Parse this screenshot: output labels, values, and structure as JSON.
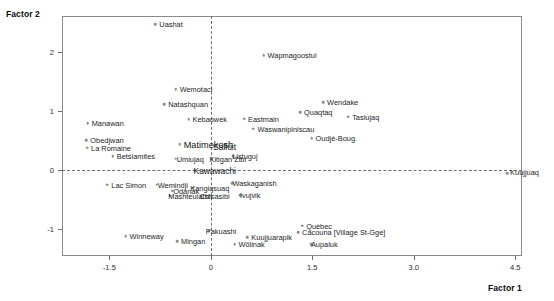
{
  "axes": {
    "x_title": "Factor 1",
    "y_title": "Factor 2",
    "x_ticks": [
      "-1.5",
      "0",
      "1.5",
      "3.0",
      "4.5"
    ],
    "y_ticks": [
      "2",
      "1",
      "0",
      "-1"
    ]
  },
  "chart_data": {
    "type": "scatter",
    "title": "",
    "xlabel": "Factor 1",
    "ylabel": "Factor 2",
    "xlim": [
      -2.2,
      4.6
    ],
    "ylim": [
      -1.45,
      2.6
    ],
    "xticks": [
      -1.5,
      0,
      1.5,
      3.0,
      4.5
    ],
    "yticks": [
      2,
      1,
      0,
      -1
    ],
    "grid": false,
    "legend": "none",
    "reference_lines": [
      {
        "orientation": "vertical",
        "value": 0,
        "style": "dashed"
      },
      {
        "orientation": "horizontal",
        "value": 0,
        "style": "dashed"
      }
    ],
    "points": [
      {
        "label": "Uashat",
        "x": -0.82,
        "y": 2.46,
        "label_dx": 4,
        "label_dy": -3,
        "size": "small"
      },
      {
        "label": "Wapmagoostui",
        "x": 0.78,
        "y": 1.94,
        "label_dx": 4,
        "label_dy": -3,
        "size": "small"
      },
      {
        "label": "Wemotaci",
        "x": -0.52,
        "y": 1.36,
        "label_dx": 4,
        "label_dy": -3,
        "size": "small"
      },
      {
        "label": "Natashquan",
        "x": -0.69,
        "y": 1.11,
        "label_dx": 4,
        "label_dy": -3,
        "size": "small"
      },
      {
        "label": "Wendake",
        "x": 1.66,
        "y": 1.15,
        "label_dx": 4,
        "label_dy": -3,
        "size": "small"
      },
      {
        "label": "Quaqtaq",
        "x": 1.32,
        "y": 0.98,
        "label_dx": 4,
        "label_dy": -3,
        "size": "small"
      },
      {
        "label": "Kebaowek",
        "x": -0.33,
        "y": 0.86,
        "label_dx": 4,
        "label_dy": -3,
        "size": "small"
      },
      {
        "label": "Eastmain",
        "x": 0.49,
        "y": 0.87,
        "label_dx": 4,
        "label_dy": -3,
        "size": "small"
      },
      {
        "label": "Tasiujaq",
        "x": 2.03,
        "y": 0.9,
        "label_dx": 4,
        "label_dy": -3,
        "size": "small"
      },
      {
        "label": "Manawan",
        "x": -1.82,
        "y": 0.79,
        "label_dx": 4,
        "label_dy": -3,
        "size": "small"
      },
      {
        "label": "Waswanipiniscau",
        "x": 0.63,
        "y": 0.7,
        "label_dx": 4,
        "label_dy": -3,
        "size": "small"
      },
      {
        "label": "Oudjé-Boug.",
        "x": 1.49,
        "y": 0.54,
        "label_dx": 4,
        "label_dy": -3,
        "size": "small"
      },
      {
        "label": "Obedjwan",
        "x": -1.84,
        "y": 0.5,
        "label_dx": 4,
        "label_dy": -3,
        "size": "small"
      },
      {
        "label": "Matimekosh",
        "x": -0.46,
        "y": 0.44,
        "label_dx": 4,
        "label_dy": -3,
        "size": "big"
      },
      {
        "label": "Salluit",
        "x": 0.05,
        "y": 0.42,
        "label_dx": -1,
        "label_dy": -2,
        "size": "mid"
      },
      {
        "label": "La Romaine",
        "x": -1.83,
        "y": 0.38,
        "label_dx": 4,
        "label_dy": -3,
        "size": "small"
      },
      {
        "label": "Betsiamites",
        "x": -1.45,
        "y": 0.23,
        "label_dx": 4,
        "label_dy": -3,
        "size": "small"
      },
      {
        "label": "Umiujaq",
        "x": -0.52,
        "y": 0.19,
        "label_dx": 1,
        "label_dy": -3,
        "size": "small"
      },
      {
        "label": "Kitigan Zibi",
        "x": 0.01,
        "y": 0.18,
        "label_dx": -2,
        "label_dy": -3,
        "size": "small"
      },
      {
        "label": "Listuguj",
        "x": 0.33,
        "y": 0.23,
        "label_dx": -1,
        "label_dy": -3,
        "size": "small"
      },
      {
        "label": "Kuujjuaq",
        "x": 4.38,
        "y": -0.05,
        "label_dx": 3,
        "label_dy": -4,
        "size": "small"
      },
      {
        "label": "Kawawachi",
        "x": -0.24,
        "y": 0.0,
        "label_dx": -1,
        "label_dy": -3,
        "size": "mid"
      },
      {
        "label": "Lac Simon",
        "x": -1.53,
        "y": -0.25,
        "label_dx": 4,
        "label_dy": -3,
        "size": "small"
      },
      {
        "label": "Wemindji",
        "x": -0.8,
        "y": -0.25,
        "label_dx": 1,
        "label_dy": -3,
        "size": "small"
      },
      {
        "label": "Kangiqsuaq",
        "x": -0.26,
        "y": -0.3,
        "label_dx": -3,
        "label_dy": -3,
        "size": "small"
      },
      {
        "label": "Waskaganish",
        "x": 0.32,
        "y": -0.22,
        "label_dx": 0,
        "label_dy": -3,
        "size": "small"
      },
      {
        "label": "Odanak",
        "x": -0.57,
        "y": -0.35,
        "label_dx": 1,
        "label_dy": -3,
        "size": "small"
      },
      {
        "label": "Mashteuiatsh",
        "x": -0.6,
        "y": -0.43,
        "label_dx": -2,
        "label_dy": -3,
        "size": "small"
      },
      {
        "label": "Ivujvik",
        "x": 0.43,
        "y": -0.42,
        "label_dx": 0,
        "label_dy": -3,
        "size": "small"
      },
      {
        "label": "Chisasibi",
        "x": -0.15,
        "y": -0.43,
        "label_dx": -1,
        "label_dy": -3,
        "size": "small"
      },
      {
        "label": "Québec",
        "x": 1.35,
        "y": -0.94,
        "label_dx": 4,
        "label_dy": -3,
        "size": "small"
      },
      {
        "label": "Cacouna  [Village St-Gge]",
        "x": 1.29,
        "y": -1.05,
        "label_dx": 4,
        "label_dy": -3,
        "size": "small"
      },
      {
        "label": "Pakuashi",
        "x": -0.03,
        "y": -1.03,
        "label_dx": -3,
        "label_dy": -3,
        "size": "small"
      },
      {
        "label": "Winneway",
        "x": -1.26,
        "y": -1.12,
        "label_dx": 4,
        "label_dy": -3,
        "size": "small"
      },
      {
        "label": "Kuujjuarapik",
        "x": 0.54,
        "y": -1.13,
        "label_dx": 4,
        "label_dy": -3,
        "size": "small"
      },
      {
        "label": "Aupaluk",
        "x": 1.48,
        "y": -1.25,
        "label_dx": 0,
        "label_dy": -3,
        "size": "small"
      },
      {
        "label": "Mingan",
        "x": -0.5,
        "y": -1.2,
        "label_dx": 4,
        "label_dy": -3,
        "size": "small"
      },
      {
        "label": "Wôlinak",
        "x": 0.35,
        "y": -1.25,
        "label_dx": 4,
        "label_dy": -3,
        "size": "small"
      }
    ]
  }
}
